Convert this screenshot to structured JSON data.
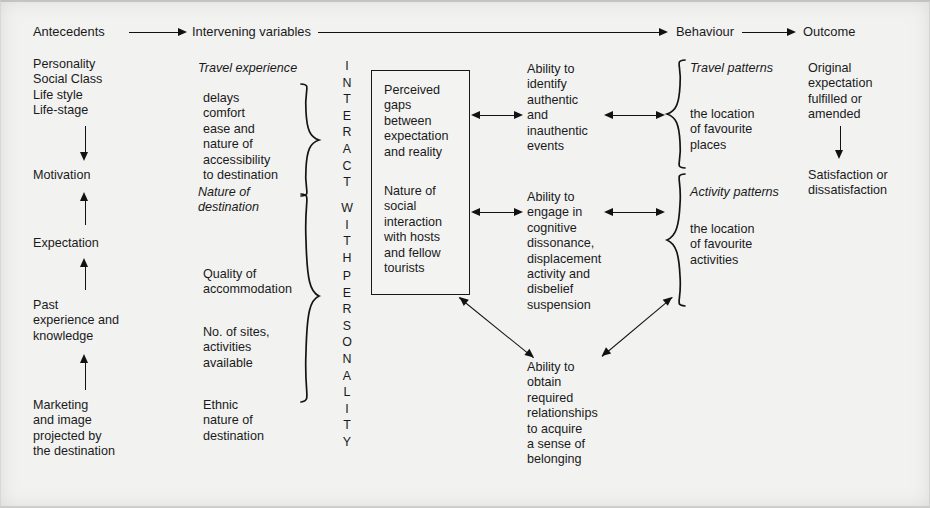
{
  "figure": {
    "columns": {
      "antecedents": {
        "heading": "Antecedents",
        "items": [
          "Personality\nSocial Class\nLife style\nLife-stage",
          "Motivation",
          "Expectation",
          "Past\nexperience and\nknowledge",
          "Marketing\nand image\nprojected by\nthe destination"
        ]
      },
      "intervening": {
        "heading": "Intervening variables",
        "group_travel_label": "Travel experience",
        "group_travel_items": "delays\ncomfort\nease and\nnature of\naccessibility\nto destination",
        "group_destination_label": "Nature of\ndestination",
        "group_destination_items": [
          "Quality of\naccommodation",
          "No. of sites,\nactivities\navailable",
          "Ethnic\nnature of\ndestination"
        ]
      },
      "interaction_axis": {
        "line1": "INTERACT",
        "line2": "WITH",
        "line3": "PERSONALITY"
      },
      "perception_box": {
        "block1": "Perceived\ngaps\nbetween\nexpectation\nand reality",
        "block2": "Nature of\nsocial\ninteraction\nwith hosts\nand fellow\ntourists"
      },
      "abilities": [
        "Ability to\nidentify\nauthentic\nand\ninauthentic\nevents",
        "Ability to\nengage in\ncognitive\ndissonance,\ndisplacement\nactivity and\ndisbelief\nsuspension",
        "Ability to\nobtain\nrequired\nrelationships\nto acquire\na sense of\nbelonging"
      ],
      "behaviour": {
        "heading": "Behaviour",
        "group_travel_label": "Travel patterns",
        "group_travel_items": "the location\nof favourite\nplaces",
        "group_activity_label": "Activity patterns",
        "group_activity_items": "the location\nof favourite\nactivities"
      },
      "outcome": {
        "heading": "Outcome",
        "items": [
          "Original\nexpectation\nfulfilled or\namended",
          "Satisfaction or\ndissatisfaction"
        ]
      }
    },
    "colors": {
      "ink": "#121212",
      "page": "#f2f2f1",
      "box_fill": "#f3f3f2"
    }
  }
}
